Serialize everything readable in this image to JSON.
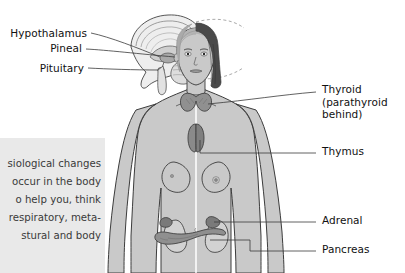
{
  "figure": {
    "background_color": "#ffffff",
    "line_color": "#333333",
    "organ_fill": "#8c8c8c",
    "skin_fill": "#c9c9c9",
    "hair_dark": "#4a4a4a",
    "hair_light": "#b4b4b4"
  },
  "left_labels": [
    {
      "id": "hypothalamus",
      "text": "Hypothalamus"
    },
    {
      "id": "pineal",
      "text": "Pineal"
    },
    {
      "id": "pituitary",
      "text": "Pituitary"
    }
  ],
  "right_labels": [
    {
      "id": "thyroid",
      "line1": "Thyroid",
      "line2": "(parathyroid",
      "line3": "behind)"
    },
    {
      "id": "thymus",
      "line1": "Thymus"
    },
    {
      "id": "adrenal",
      "line1": "Adrenal"
    },
    {
      "id": "pancreas",
      "line1": "Pancreas"
    }
  ],
  "excerpt_box": {
    "background_color": "#e9e9e9",
    "lines": [
      "siological  changes",
      "occur  in  the  body",
      "o  help  you,  think",
      "respiratory,  meta-",
      "stural  and  body"
    ]
  }
}
